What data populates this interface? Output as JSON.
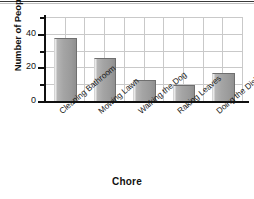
{
  "chart_data": {
    "type": "bar",
    "title": "",
    "xlabel": "Chore",
    "ylabel": "Number of People",
    "categories": [
      "Cleaning Bathroom",
      "Mowing Lawn",
      "Walking the Dog",
      "Raking Leaves",
      "Doing the Dishes"
    ],
    "values": [
      37,
      25,
      12,
      9,
      16
    ],
    "ylim": [
      0,
      50
    ],
    "ytick_labels": [
      "0",
      "20",
      "40"
    ],
    "ytick_values": [
      0,
      20,
      40
    ],
    "yminor_values": [
      10,
      30,
      50
    ],
    "grid": true,
    "legend": null,
    "bar_color": "#a0a0a0",
    "bar_edge_color": "#6f6f6f",
    "grid_color": "#c9c9c9",
    "axis_color": "#101010"
  },
  "axes": {
    "y_title": "Number of People",
    "x_title": "Chore"
  }
}
